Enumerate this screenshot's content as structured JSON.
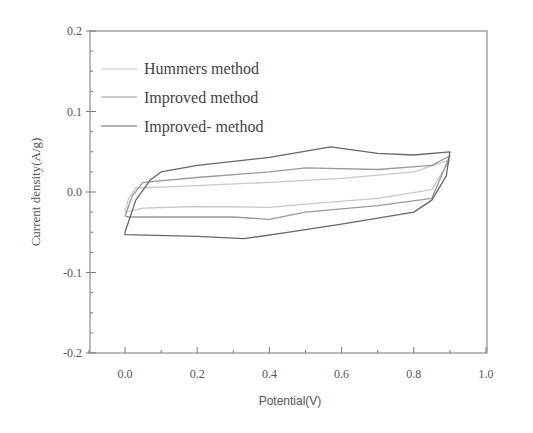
{
  "chart_data": {
    "type": "line",
    "title": "",
    "xlabel": "Potential(V)",
    "ylabel": "Current density(A/g)",
    "xlim": [
      -0.1,
      1.0
    ],
    "ylim": [
      -0.2,
      0.2
    ],
    "xticks": [
      "0.0",
      "0.2",
      "0.4",
      "0.6",
      "0.8",
      "1.0"
    ],
    "yticks": [
      "0.2",
      "0.1",
      "0.0",
      "-0.1",
      "-0.2"
    ],
    "grid": false,
    "legend_position": "upper-left",
    "series": [
      {
        "name": "Hummers method",
        "color": "#c8c8c8",
        "x": [
          0.0,
          0.01,
          0.03,
          0.1,
          0.2,
          0.4,
          0.6,
          0.8,
          0.9,
          0.9,
          0.85,
          0.7,
          0.5,
          0.4,
          0.2,
          0.05,
          0.0
        ],
        "y": [
          -0.025,
          -0.008,
          0.005,
          0.006,
          0.008,
          0.012,
          0.017,
          0.025,
          0.04,
          0.04,
          0.003,
          -0.008,
          -0.015,
          -0.019,
          -0.018,
          -0.02,
          -0.025
        ]
      },
      {
        "name": "Improved method",
        "color": "#999999",
        "x": [
          0.0,
          0.02,
          0.05,
          0.2,
          0.4,
          0.5,
          0.7,
          0.85,
          0.9,
          0.9,
          0.85,
          0.7,
          0.5,
          0.4,
          0.3,
          0.1,
          0.01,
          0.0
        ],
        "y": [
          -0.03,
          -0.005,
          0.012,
          0.018,
          0.025,
          0.03,
          0.028,
          0.033,
          0.045,
          0.045,
          -0.008,
          -0.017,
          -0.025,
          -0.034,
          -0.031,
          -0.031,
          -0.031,
          -0.03
        ]
      },
      {
        "name": "Improved- method",
        "color": "#666666",
        "x": [
          0.0,
          0.03,
          0.07,
          0.1,
          0.2,
          0.4,
          0.57,
          0.7,
          0.8,
          0.9,
          0.89,
          0.85,
          0.8,
          0.6,
          0.45,
          0.33,
          0.2,
          0.0
        ],
        "y": [
          -0.05,
          -0.01,
          0.015,
          0.025,
          0.033,
          0.043,
          0.056,
          0.048,
          0.046,
          0.05,
          0.02,
          -0.01,
          -0.025,
          -0.04,
          -0.05,
          -0.058,
          -0.055,
          -0.053
        ]
      }
    ]
  },
  "legend": {
    "items": [
      {
        "label": "Hummers method",
        "color": "#c8c8c8"
      },
      {
        "label": "Improved method",
        "color": "#999999"
      },
      {
        "label": "Improved- method",
        "color": "#666666"
      }
    ]
  },
  "axes": {
    "x_title": "Potential(V)",
    "y_title": "Current density(A/g)"
  }
}
